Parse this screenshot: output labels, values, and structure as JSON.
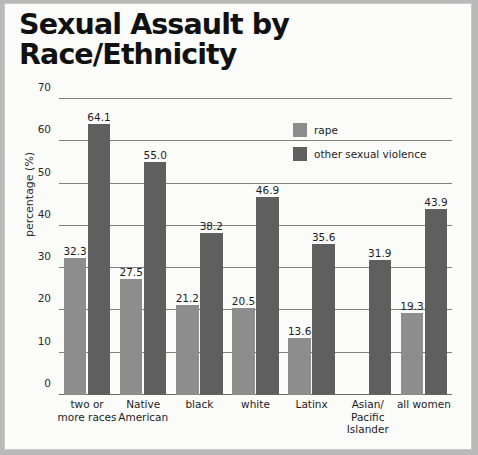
{
  "title": {
    "line1": "Sexual Assault by",
    "line2": "Race/Ethnicity"
  },
  "legend": {
    "rape_label": "rape",
    "osv_label": "other sexual violence"
  },
  "colors": {
    "rape": "#8d8d8d",
    "other_sexual_violence": "#5f5f5f",
    "background": "#fbfbfa",
    "gridline": "#7f7f7f",
    "text": "#1d1d1d"
  },
  "chart_data": {
    "type": "bar",
    "title": "Sexual Assault by Race/Ethnicity",
    "xlabel": "",
    "ylabel": "percentage (%)",
    "ylim": [
      0,
      70
    ],
    "yticks": [
      0,
      10,
      20,
      30,
      40,
      50,
      60,
      70
    ],
    "ytick_labels": [
      "0",
      "10",
      "20",
      "30",
      "40",
      "50",
      "60",
      "70"
    ],
    "grid": true,
    "legend_position": "upper right",
    "categories": [
      "two or\nmore races",
      "Native\nAmerican",
      "black",
      "white",
      "Latinx",
      "Asian/\nPacific\nIslander",
      "all women"
    ],
    "category_lines": [
      [
        "two or",
        "more races"
      ],
      [
        "Native",
        "American"
      ],
      [
        "black"
      ],
      [
        "white"
      ],
      [
        "Latinx"
      ],
      [
        "Asian/",
        "Pacific",
        "Islander"
      ],
      [
        "all women"
      ]
    ],
    "series": [
      {
        "name": "rape",
        "color": "#8d8d8d",
        "values": [
          32.3,
          27.5,
          21.2,
          20.5,
          13.6,
          null,
          19.3
        ],
        "labels": [
          "32.3",
          "27.5",
          "21.2",
          "20.5",
          "13.6",
          "",
          "19.3"
        ]
      },
      {
        "name": "other sexual violence",
        "color": "#5f5f5f",
        "values": [
          64.1,
          55.0,
          38.2,
          46.9,
          35.6,
          31.9,
          43.9
        ],
        "labels": [
          "64.1",
          "55.0",
          "38.2",
          "46.9",
          "35.6",
          "31.9",
          "43.9"
        ]
      }
    ]
  }
}
